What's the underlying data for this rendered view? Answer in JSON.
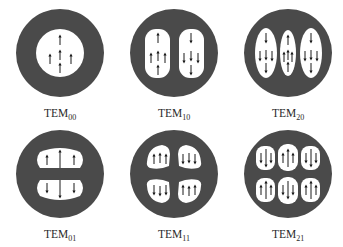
{
  "diagram": {
    "type": "transverse-mode-patterns",
    "colors": {
      "ring": "#4a4a4a",
      "lobe": "#ffffff",
      "arrow": "#1a1a1a",
      "text": "#2a2a2a"
    },
    "modes": [
      {
        "id": "tem00",
        "prefix": "TEM",
        "subscript": "00",
        "lobes_x": 1,
        "lobes_y": 1
      },
      {
        "id": "tem10",
        "prefix": "TEM",
        "subscript": "10",
        "lobes_x": 2,
        "lobes_y": 1
      },
      {
        "id": "tem20",
        "prefix": "TEM",
        "subscript": "20",
        "lobes_x": 3,
        "lobes_y": 1
      },
      {
        "id": "tem01",
        "prefix": "TEM",
        "subscript": "01",
        "lobes_x": 1,
        "lobes_y": 2
      },
      {
        "id": "tem11",
        "prefix": "TEM",
        "subscript": "11",
        "lobes_x": 2,
        "lobes_y": 2
      },
      {
        "id": "tem21",
        "prefix": "TEM",
        "subscript": "21",
        "lobes_x": 3,
        "lobes_y": 2
      }
    ]
  }
}
